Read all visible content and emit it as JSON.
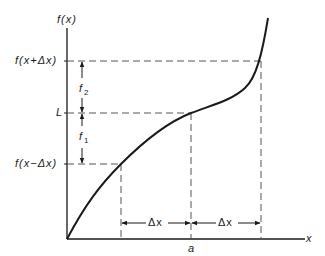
{
  "diagram": {
    "type": "function-graph",
    "axes": {
      "y_label": "f(x)",
      "x_label": "x"
    },
    "y_marks": [
      {
        "label": "f(x+Δx)",
        "y": 61
      },
      {
        "label": "L",
        "y": 113
      },
      {
        "label": "f(x−Δx)",
        "y": 164
      }
    ],
    "x_marks": [
      {
        "label": "a",
        "x": 191
      }
    ],
    "vertical_intervals": [
      {
        "label": "f",
        "subscript": "2",
        "from": "L",
        "to": "f(x+Δx)"
      },
      {
        "label": "f",
        "subscript": "1",
        "from": "f(x−Δx)",
        "to": "L"
      }
    ],
    "horizontal_intervals": [
      {
        "label": "Δx",
        "from_x": 121,
        "to_x": 191
      },
      {
        "label": "Δx",
        "from_x": 191,
        "to_x": 261
      }
    ],
    "colors": {
      "line": "#1a1a1a",
      "dash": "#555555",
      "background": "#ffffff"
    }
  }
}
